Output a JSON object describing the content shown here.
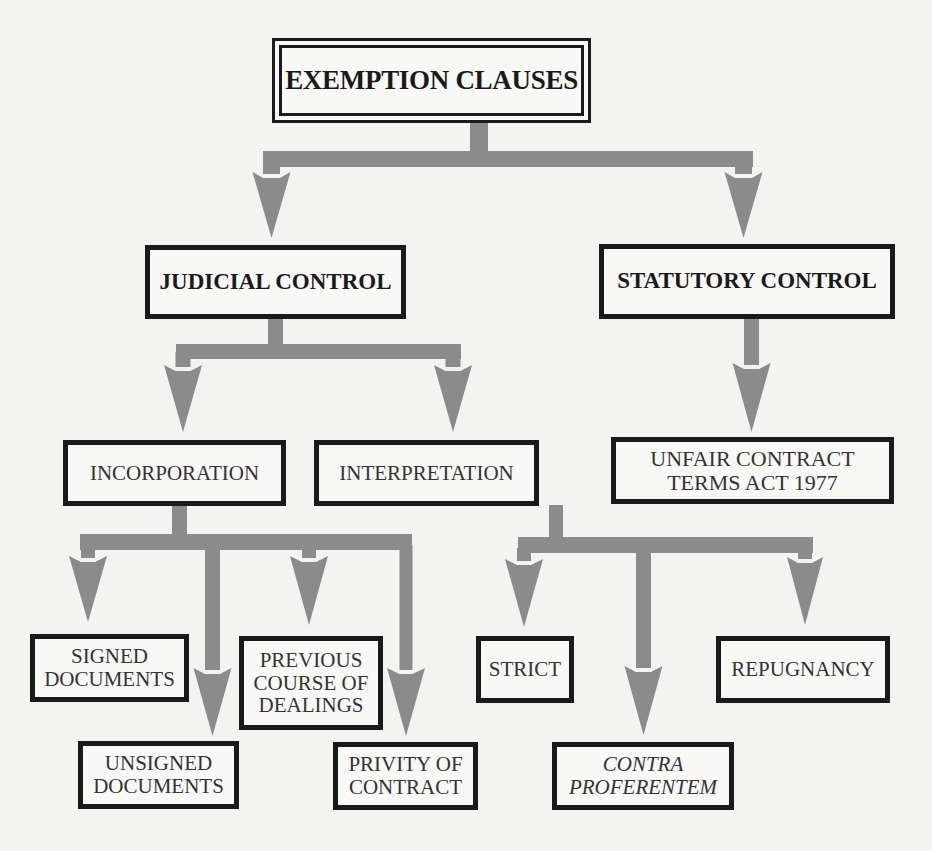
{
  "diagram": {
    "type": "hierarchy",
    "colors": {
      "arrow": "#8b8b8b",
      "border": "#1a1a1a",
      "background": "#f3f3f1"
    },
    "cutoff_text": "",
    "nodes": {
      "root": {
        "lines": [
          "EXEMPTION CLAUSES"
        ]
      },
      "judicial": {
        "lines": [
          "JUDICIAL CONTROL"
        ]
      },
      "statutory": {
        "lines": [
          "STATUTORY CONTROL"
        ]
      },
      "incorporation": {
        "lines": [
          "INCORPORATION"
        ]
      },
      "interpretation": {
        "lines": [
          "INTERPRETATION"
        ]
      },
      "ucta": {
        "lines": [
          "UNFAIR CONTRACT",
          "TERMS ACT 1977"
        ]
      },
      "signed": {
        "lines": [
          "SIGNED",
          "DOCUMENTS"
        ]
      },
      "unsigned": {
        "lines": [
          "UNSIGNED",
          "DOCUMENTS"
        ]
      },
      "previous": {
        "lines": [
          "PREVIOUS",
          "COURSE OF",
          "DEALINGS"
        ]
      },
      "privity": {
        "lines": [
          "PRIVITY OF",
          "CONTRACT"
        ]
      },
      "strict": {
        "lines": [
          "STRICT"
        ]
      },
      "contra": {
        "lines": [
          "CONTRA",
          "PROFERENTEM"
        ]
      },
      "repugnancy": {
        "lines": [
          "REPUGNANCY"
        ]
      }
    },
    "edges": [
      {
        "from": "root",
        "to": "judicial"
      },
      {
        "from": "root",
        "to": "statutory"
      },
      {
        "from": "judicial",
        "to": "incorporation"
      },
      {
        "from": "judicial",
        "to": "interpretation"
      },
      {
        "from": "statutory",
        "to": "ucta"
      },
      {
        "from": "incorporation",
        "to": "signed"
      },
      {
        "from": "incorporation",
        "to": "unsigned"
      },
      {
        "from": "incorporation",
        "to": "previous"
      },
      {
        "from": "incorporation",
        "to": "privity"
      },
      {
        "from": "interpretation",
        "to": "strict"
      },
      {
        "from": "interpretation",
        "to": "contra"
      },
      {
        "from": "interpretation",
        "to": "repugnancy"
      }
    ]
  }
}
